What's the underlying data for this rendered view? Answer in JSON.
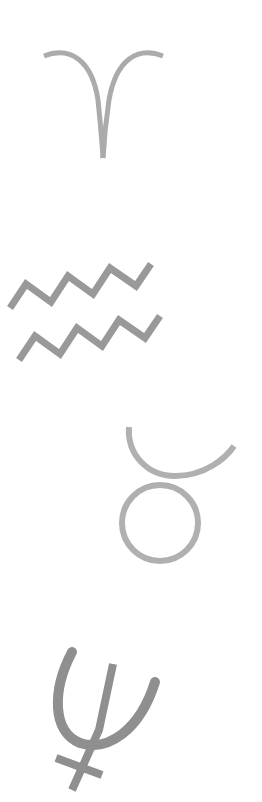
{
  "symbols": [
    {
      "name": "aries",
      "glyph": "♈",
      "color": "#ababab"
    },
    {
      "name": "aquarius",
      "glyph": "♒",
      "color": "#999999"
    },
    {
      "name": "taurus",
      "glyph": "♉",
      "color": "#b0b0b0"
    },
    {
      "name": "neptune",
      "glyph": "♆",
      "color": "#8f8f8f"
    }
  ]
}
